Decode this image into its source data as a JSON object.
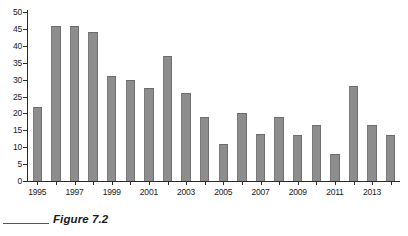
{
  "chart_data": {
    "type": "bar",
    "title": "",
    "xlabel": "",
    "ylabel": "",
    "ylim": [
      0,
      50
    ],
    "grid": false,
    "legend": "none",
    "categories": [
      "1995",
      "1996",
      "1997",
      "1998",
      "1999",
      "2000",
      "2001",
      "2002",
      "2003",
      "2004",
      "2005",
      "2006",
      "2007",
      "2008",
      "2009",
      "2010",
      "2011",
      "2012",
      "2013",
      "2014"
    ],
    "values": [
      22,
      46,
      46,
      44,
      31,
      30,
      27.5,
      37,
      26,
      19,
      11,
      20,
      14,
      19,
      13.5,
      16.5,
      8,
      28,
      16.5,
      13.5
    ],
    "y_ticks": [
      0,
      5,
      10,
      15,
      20,
      25,
      30,
      35,
      40,
      45,
      50
    ],
    "y_tick_labels": [
      "0",
      "5",
      "10",
      "15",
      "20",
      "25",
      "30",
      "35",
      "40",
      "45",
      "50"
    ],
    "x_tick_labels": [
      "1995",
      "1997",
      "1999",
      "2001",
      "2003",
      "2005",
      "2007",
      "2009",
      "2011",
      "2013"
    ],
    "x_tick_label_categories": [
      "1995",
      "1997",
      "1999",
      "2001",
      "2003",
      "2005",
      "2007",
      "2009",
      "2011",
      "2013"
    ],
    "bar_color": "#8d8d8d",
    "axis_color": "#2b2b2b",
    "background_color": "#ffffff"
  },
  "caption": {
    "text": "Figure 7.2"
  }
}
